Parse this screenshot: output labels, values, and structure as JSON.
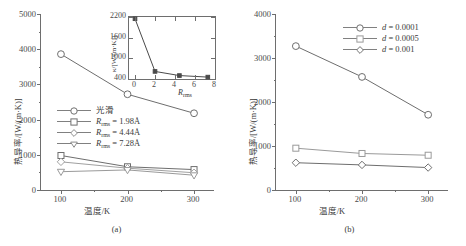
{
  "figure": {
    "panels": [
      {
        "id": "a",
        "caption": "(a)",
        "xlabel": "温度/K",
        "ylabel": "热导率/[W/(m·K)]",
        "yticks": [
          "0",
          "1000",
          "2000",
          "3000",
          "4000",
          "5000"
        ],
        "xticks": [
          "100",
          "200",
          "300"
        ],
        "legend": [
          {
            "label": "光滑",
            "marker": "circle"
          },
          {
            "label": "R_rms = 1.98Å",
            "marker": "square"
          },
          {
            "label": "R_rms = 4.44Å",
            "marker": "diamond"
          },
          {
            "label": "R_rms = 7.28Å",
            "marker": "triangle-down"
          }
        ],
        "inset": {
          "ylabel": "κ/[W/(m·K)]",
          "xlabel": "R_rms",
          "yticks": [
            "400",
            "1000",
            "1600",
            "2200"
          ],
          "xticks": [
            "0",
            "2",
            "4",
            "6",
            "8"
          ]
        }
      },
      {
        "id": "b",
        "caption": "(b)",
        "xlabel": "温度/K",
        "ylabel": "热导率/[W/(m·K)]",
        "yticks": [
          "0",
          "1000",
          "2000",
          "3000",
          "4000"
        ],
        "xticks": [
          "100",
          "200",
          "300"
        ],
        "legend": [
          {
            "label": "d = 0.0001",
            "marker": "circle"
          },
          {
            "label": "d = 0.0005",
            "marker": "square"
          },
          {
            "label": "d = 0.001",
            "marker": "diamond"
          }
        ]
      }
    ]
  },
  "chart_data": [
    {
      "type": "line",
      "panel": "(a)",
      "title": "",
      "xlabel": "温度/K",
      "ylabel": "热导率/[W/(m·K)]",
      "x": [
        100,
        200,
        300
      ],
      "xlim": [
        70,
        330
      ],
      "ylim": [
        0,
        5000
      ],
      "xticks": [
        100,
        200,
        300
      ],
      "yticks": [
        0,
        1000,
        2000,
        3000,
        4000,
        5000
      ],
      "grid": false,
      "legend_position": "center-left",
      "series": [
        {
          "name": "光滑",
          "marker": "circle",
          "values": [
            3860,
            2720,
            2180
          ]
        },
        {
          "name": "R_rms = 1.98Å",
          "marker": "square",
          "values": [
            980,
            660,
            580
          ]
        },
        {
          "name": "R_rms = 4.44Å",
          "marker": "diamond",
          "values": [
            800,
            620,
            490
          ]
        },
        {
          "name": "R_rms = 7.28Å",
          "marker": "triangle-down",
          "values": [
            520,
            570,
            420
          ]
        }
      ]
    },
    {
      "type": "line",
      "panel": "(a)-inset",
      "title": "",
      "xlabel": "R_rms",
      "ylabel": "κ/[W/(m·K)]",
      "x": [
        0,
        2,
        4.44,
        7.28
      ],
      "xlim": [
        -0.6,
        8
      ],
      "ylim": [
        400,
        2200
      ],
      "xticks": [
        0,
        2,
        4,
        6,
        8
      ],
      "yticks": [
        400,
        1000,
        1600,
        2200
      ],
      "grid": false,
      "legend_position": "none",
      "series": [
        {
          "name": "κ vs R_rms",
          "marker": "filled-square",
          "values": [
            2150,
            620,
            500,
            455
          ]
        }
      ]
    },
    {
      "type": "line",
      "panel": "(b)",
      "title": "",
      "xlabel": "温度/K",
      "ylabel": "热导率/[W/(m·K)]",
      "x": [
        100,
        200,
        300
      ],
      "xlim": [
        70,
        330
      ],
      "ylim": [
        0,
        4000
      ],
      "xticks": [
        100,
        200,
        300
      ],
      "yticks": [
        0,
        1000,
        2000,
        3000,
        4000
      ],
      "grid": false,
      "legend_position": "top-right",
      "series": [
        {
          "name": "d = 0.0001",
          "marker": "circle",
          "values": [
            3270,
            2570,
            1710
          ]
        },
        {
          "name": "d = 0.0005",
          "marker": "square",
          "values": [
            950,
            830,
            790
          ]
        },
        {
          "name": "d = 0.001",
          "marker": "diamond",
          "values": [
            620,
            570,
            510
          ]
        }
      ]
    }
  ],
  "colors": {
    "axis": "#6e6e6e",
    "line": "#808080",
    "text": "#3a3a3a",
    "background": "#ffffff"
  }
}
